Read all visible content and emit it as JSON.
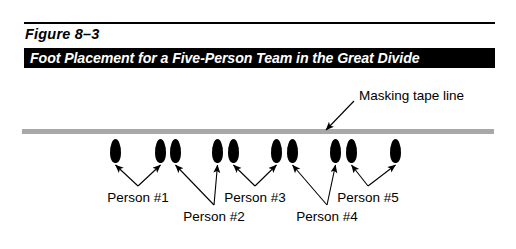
{
  "figure": {
    "number": "Figure 8–3",
    "title": "Foot Placement for a Five-Person Team in the Great Divide"
  },
  "annotations": {
    "tape_line_label": "Masking tape line"
  },
  "colors": {
    "tape_line": "#a8a8a8",
    "foot": "#000000",
    "title_bar_bg": "#000000",
    "title_bar_text": "#ffffff",
    "rule": "#000000"
  },
  "diagram": {
    "feet": [
      {
        "id": "foot-1",
        "x": 110,
        "y": 139
      },
      {
        "id": "foot-2",
        "x": 155,
        "y": 139
      },
      {
        "id": "foot-3",
        "x": 170,
        "y": 139
      },
      {
        "id": "foot-4",
        "x": 212,
        "y": 139
      },
      {
        "id": "foot-5",
        "x": 228,
        "y": 139
      },
      {
        "id": "foot-6",
        "x": 271,
        "y": 139
      },
      {
        "id": "foot-7",
        "x": 287,
        "y": 139
      },
      {
        "id": "foot-8",
        "x": 330,
        "y": 139
      },
      {
        "id": "foot-9",
        "x": 346,
        "y": 139
      },
      {
        "id": "foot-10",
        "x": 390,
        "y": 139
      }
    ],
    "persons": [
      {
        "label": "Person #1",
        "label_x": 138,
        "label_y": 190,
        "row": "upper"
      },
      {
        "label": "Person #2",
        "label_x": 214,
        "label_y": 209,
        "row": "lower"
      },
      {
        "label": "Person #3",
        "label_x": 255,
        "label_y": 190,
        "row": "upper"
      },
      {
        "label": "Person #4",
        "label_x": 327,
        "label_y": 209,
        "row": "lower"
      },
      {
        "label": "Person #5",
        "label_x": 368,
        "label_y": 190,
        "row": "upper"
      }
    ]
  }
}
